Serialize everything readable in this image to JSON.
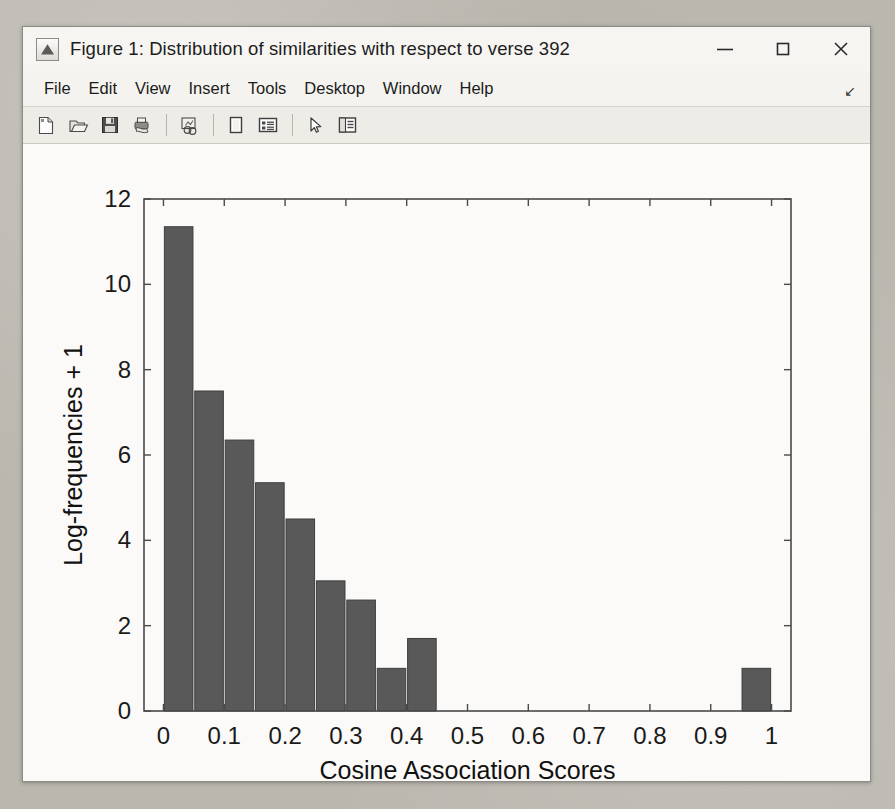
{
  "window": {
    "title": "Figure 1: Distribution of similarities with respect to verse 392",
    "app_icon": "matlab-figure-icon",
    "controls": [
      {
        "name": "minimize-button",
        "glyph": "minimize-icon"
      },
      {
        "name": "maximize-button",
        "glyph": "maximize-icon"
      },
      {
        "name": "close-button",
        "glyph": "close-icon"
      }
    ]
  },
  "menu": {
    "items": [
      {
        "label": "File"
      },
      {
        "label": "Edit"
      },
      {
        "label": "View"
      },
      {
        "label": "Insert"
      },
      {
        "label": "Tools"
      },
      {
        "label": "Desktop"
      },
      {
        "label": "Window"
      },
      {
        "label": "Help"
      }
    ],
    "overflow_glyph": "↘"
  },
  "toolbar": {
    "buttons": [
      {
        "name": "new-figure-button",
        "icon": "new-document-icon"
      },
      {
        "name": "open-file-button",
        "icon": "open-folder-icon"
      },
      {
        "name": "save-figure-button",
        "icon": "floppy-disk-save-icon"
      },
      {
        "name": "print-figure-button",
        "icon": "printer-icon"
      },
      {
        "name": "link-plot-button",
        "icon": "link-plot-icon"
      },
      {
        "name": "insert-colorbar-button",
        "icon": "colorbar-icon"
      },
      {
        "name": "insert-legend-button",
        "icon": "legend-icon"
      },
      {
        "name": "edit-plot-button",
        "icon": "arrow-pointer-icon"
      },
      {
        "name": "hide-plot-tools-button",
        "icon": "plot-tools-panel-icon"
      }
    ]
  },
  "chart_data": {
    "type": "bar",
    "title": "",
    "xlabel": "Cosine Association Scores",
    "ylabel": "Log-frequencies + 1",
    "xlim": [
      -0.032,
      1.032
    ],
    "ylim": [
      0,
      12
    ],
    "xticks": [
      0,
      0.1,
      0.2,
      0.3,
      0.4,
      0.5,
      0.6,
      0.7,
      0.8,
      0.9,
      1
    ],
    "xticklabels": [
      "0",
      "0.1",
      "0.2",
      "0.3",
      "0.4",
      "0.5",
      "0.6",
      "0.7",
      "0.8",
      "0.9",
      "1"
    ],
    "yticks": [
      0,
      2,
      4,
      6,
      8,
      10,
      12
    ],
    "yticklabels": [
      "0",
      "2",
      "4",
      "6",
      "8",
      "10",
      "12"
    ],
    "grid": false,
    "legend": null,
    "bar_color": "#595959",
    "bar_edge_color": "#3d3d3d",
    "bar_width_units": 0.047,
    "bin_centers": [
      0.025,
      0.075,
      0.125,
      0.175,
      0.225,
      0.275,
      0.325,
      0.375,
      0.425,
      0.975
    ],
    "values": [
      11.35,
      7.5,
      6.35,
      5.35,
      4.5,
      3.05,
      2.6,
      1.0,
      1.7,
      1.0
    ],
    "categories": [
      "0.00-0.05",
      "0.05-0.10",
      "0.10-0.15",
      "0.15-0.20",
      "0.20-0.25",
      "0.25-0.30",
      "0.30-0.35",
      "0.35-0.40",
      "0.40-0.45",
      "0.95-1.00"
    ]
  }
}
